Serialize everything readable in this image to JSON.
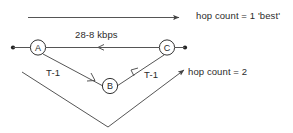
{
  "diagram": {
    "title_absent": true,
    "nodes": [
      {
        "id": "A",
        "label": "A",
        "x": 38,
        "y": 48
      },
      {
        "id": "B",
        "label": "B",
        "x": 110,
        "y": 86
      },
      {
        "id": "C",
        "label": "C",
        "x": 167,
        "y": 48
      }
    ],
    "links": [
      {
        "id": "a-c",
        "from": "A",
        "to": "C",
        "label": "28-8 kbps",
        "label_name": "link-speed-label"
      },
      {
        "id": "a-b",
        "from": "A",
        "to": "B",
        "label": "T-1",
        "label_name": "link-t1-left-label"
      },
      {
        "id": "b-c",
        "from": "B",
        "to": "C",
        "label": "T-1",
        "label_name": "link-t1-right-label"
      }
    ],
    "annotations": [
      {
        "id": "hop1",
        "text": "hop count = 1 'best'"
      },
      {
        "id": "hop2",
        "text": "hop count = 2"
      }
    ],
    "colors": {
      "ink": "#2b2b2b",
      "line": "#555555",
      "background": "#ffffff"
    }
  }
}
